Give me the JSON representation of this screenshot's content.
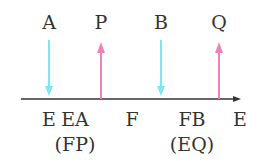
{
  "colors": {
    "cyan": "#7ee6f0",
    "pink": "#f080b8",
    "axis": "#333333"
  },
  "top_labels": [
    {
      "text": "A",
      "x": 49
    },
    {
      "text": "P",
      "x": 101
    },
    {
      "text": "B",
      "x": 161
    },
    {
      "text": "Q",
      "x": 219
    }
  ],
  "bottom_labels": [
    {
      "text": "E",
      "x": 49,
      "row": 1
    },
    {
      "text": "EA",
      "x": 75,
      "row": 1
    },
    {
      "text": "F",
      "x": 132,
      "row": 1
    },
    {
      "text": "FB",
      "x": 192,
      "row": 1
    },
    {
      "text": "E",
      "x": 240,
      "row": 1
    },
    {
      "text": "(FP)",
      "x": 75,
      "row": 2
    },
    {
      "text": "(EQ)",
      "x": 192,
      "row": 2
    }
  ],
  "arrows": [
    {
      "x": 49,
      "dir": "down",
      "color": "cyan"
    },
    {
      "x": 101,
      "dir": "up",
      "color": "pink"
    },
    {
      "x": 161,
      "dir": "down",
      "color": "cyan"
    },
    {
      "x": 219,
      "dir": "up",
      "color": "pink"
    }
  ]
}
